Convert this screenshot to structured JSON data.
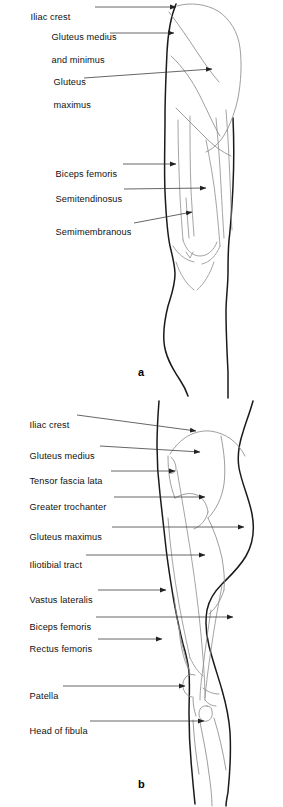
{
  "figure": {
    "background_color": "#ffffff",
    "outline_color": "#1a1a1a",
    "muscle_line_color": "#8a8a8a",
    "leader_color": "#333333",
    "panels": [
      {
        "id": "a",
        "letter": "a",
        "view": "posterior",
        "labels": [
          {
            "id": "iliac-crest",
            "text": "Iliac crest",
            "lines": [
              "Iliac crest"
            ]
          },
          {
            "id": "gluteus-medius",
            "text": "Gluteus medius and minimus",
            "lines": [
              "Gluteus medius",
              "and minimus"
            ]
          },
          {
            "id": "gluteus-maximus",
            "text": "Gluteus maximus",
            "lines": [
              "Gluteus",
              "maximus"
            ]
          },
          {
            "id": "biceps-femoris",
            "text": "Biceps femoris",
            "lines": [
              "Biceps femoris"
            ]
          },
          {
            "id": "semitendinosus",
            "text": "Semitendinosus",
            "lines": [
              "Semitendinosus"
            ]
          },
          {
            "id": "semimembranous",
            "text": "Semimembranous",
            "lines": [
              "Semimembranous"
            ]
          }
        ]
      },
      {
        "id": "b",
        "letter": "b",
        "view": "lateral",
        "labels": [
          {
            "id": "iliac-crest",
            "text": "Iliac crest",
            "lines": [
              "Iliac crest"
            ]
          },
          {
            "id": "gluteus-medius",
            "text": "Gluteus medius",
            "lines": [
              "Gluteus medius"
            ]
          },
          {
            "id": "tensor-fascia-lata",
            "text": "Tensor fascia lata",
            "lines": [
              "Tensor fascia lata"
            ]
          },
          {
            "id": "greater-trochanter",
            "text": "Greater trochanter",
            "lines": [
              "Greater trochanter"
            ]
          },
          {
            "id": "gluteus-maximus",
            "text": "Gluteus maximus",
            "lines": [
              "Gluteus maximus"
            ]
          },
          {
            "id": "iliotibial-tract",
            "text": "Iliotibial tract",
            "lines": [
              "Iliotibial tract"
            ]
          },
          {
            "id": "vastus-lateralis",
            "text": "Vastus lateralis",
            "lines": [
              "Vastus lateralis"
            ]
          },
          {
            "id": "biceps-femoris",
            "text": "Biceps femoris",
            "lines": [
              "Biceps femoris"
            ]
          },
          {
            "id": "rectus-femoris",
            "text": "Rectus femoris",
            "lines": [
              "Rectus femoris"
            ]
          },
          {
            "id": "patella",
            "text": "Patella",
            "lines": [
              "Patella"
            ]
          },
          {
            "id": "head-of-fibula",
            "text": "Head of fibula",
            "lines": [
              "Head of fibula"
            ]
          }
        ]
      }
    ]
  }
}
